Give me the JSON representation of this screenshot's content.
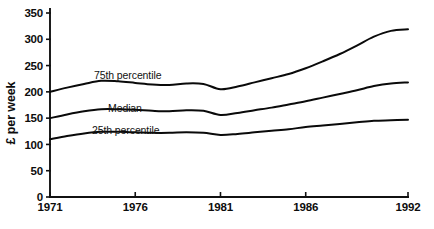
{
  "chart_data": {
    "type": "line",
    "title": "",
    "xlabel": "",
    "ylabel": "£ per week",
    "xlim": [
      1971,
      1992
    ],
    "ylim": [
      0,
      350
    ],
    "grid": false,
    "legend": "inline-labels",
    "y_ticks": [
      0,
      50,
      100,
      150,
      200,
      250,
      300,
      350
    ],
    "y_tick_labels": [
      "0",
      "50",
      "100",
      "150",
      "200",
      "250",
      "300",
      "350"
    ],
    "x_ticks": [
      1971,
      1976,
      1981,
      1986,
      1992
    ],
    "x_tick_labels": [
      "1971",
      "1976",
      "1981",
      "1986",
      "1992"
    ],
    "x": [
      1971,
      1972,
      1973,
      1974,
      1975,
      1976,
      1977,
      1978,
      1979,
      1980,
      1981,
      1982,
      1983,
      1984,
      1985,
      1986,
      1987,
      1988,
      1989,
      1990,
      1991,
      1992
    ],
    "series": [
      {
        "name": "75th percentile",
        "label": "75th percentile",
        "values": [
          200,
          208,
          215,
          221,
          220,
          217,
          214,
          213,
          216,
          215,
          205,
          210,
          218,
          226,
          234,
          245,
          258,
          272,
          288,
          305,
          316,
          319
        ]
      },
      {
        "name": "Median",
        "label": "Median",
        "values": [
          150,
          157,
          163,
          167,
          167,
          166,
          164,
          163,
          165,
          164,
          156,
          160,
          165,
          170,
          176,
          182,
          189,
          196,
          203,
          211,
          216,
          218
        ]
      },
      {
        "name": "25th percentile",
        "label": "25th percentile",
        "values": [
          110,
          116,
          121,
          124,
          124,
          123,
          122,
          122,
          123,
          122,
          118,
          120,
          123,
          126,
          129,
          133,
          136,
          139,
          142,
          145,
          146,
          147
        ]
      }
    ],
    "annotations": [
      {
        "text": "75th percentile",
        "series": "75th percentile"
      },
      {
        "text": "Median",
        "series": "Median"
      },
      {
        "text": "25th percentile",
        "series": "25th percentile"
      }
    ]
  }
}
